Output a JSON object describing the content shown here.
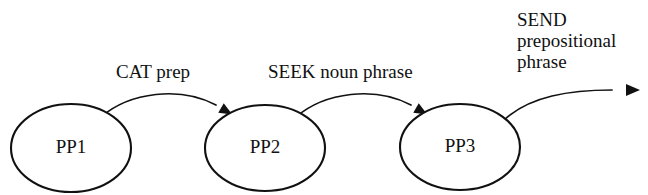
{
  "diagram": {
    "colors": {
      "background": "#ffffff",
      "stroke": "#111111",
      "text": "#111111"
    },
    "nodes": [
      {
        "id": "PP1",
        "label": "PP1",
        "cx": 71,
        "cy": 148,
        "rx": 60,
        "ry": 44
      },
      {
        "id": "PP2",
        "label": "PP2",
        "cx": 265,
        "cy": 148,
        "rx": 60,
        "ry": 43
      },
      {
        "id": "PP3",
        "label": "PP3",
        "cx": 460,
        "cy": 147,
        "rx": 60,
        "ry": 43
      }
    ],
    "edges": [
      {
        "id": "pp1-pp2",
        "from": "PP1",
        "to": "PP2",
        "label": "CAT prep",
        "label_lines": [
          "CAT prep"
        ],
        "label_x": 116,
        "label_y": 78,
        "path": "M 101 117 C 130 92 180 86 216 105",
        "arrow_x": 221,
        "arrow_y": 108,
        "arrow_angle": 30
      },
      {
        "id": "pp2-pp3",
        "from": "PP2",
        "to": "PP3",
        "label": "SEEK noun phrase",
        "label_lines": [
          "SEEK noun phrase"
        ],
        "label_x": 268,
        "label_y": 78,
        "path": "M 296 117 C 325 92 375 86 411 105",
        "arrow_x": 416,
        "arrow_y": 108,
        "arrow_angle": 30
      },
      {
        "id": "pp3-exit",
        "from": "PP3",
        "to": "exit",
        "label": "SEND prepositional phrase",
        "label_lines": [
          "SEND",
          "prepositional",
          "phrase"
        ],
        "label_x": 517,
        "label_y": 26,
        "path": "M 504 120 C 530 96 570 90 612 90",
        "arrow_x": 626,
        "arrow_y": 90,
        "arrow_angle": 0
      }
    ]
  }
}
